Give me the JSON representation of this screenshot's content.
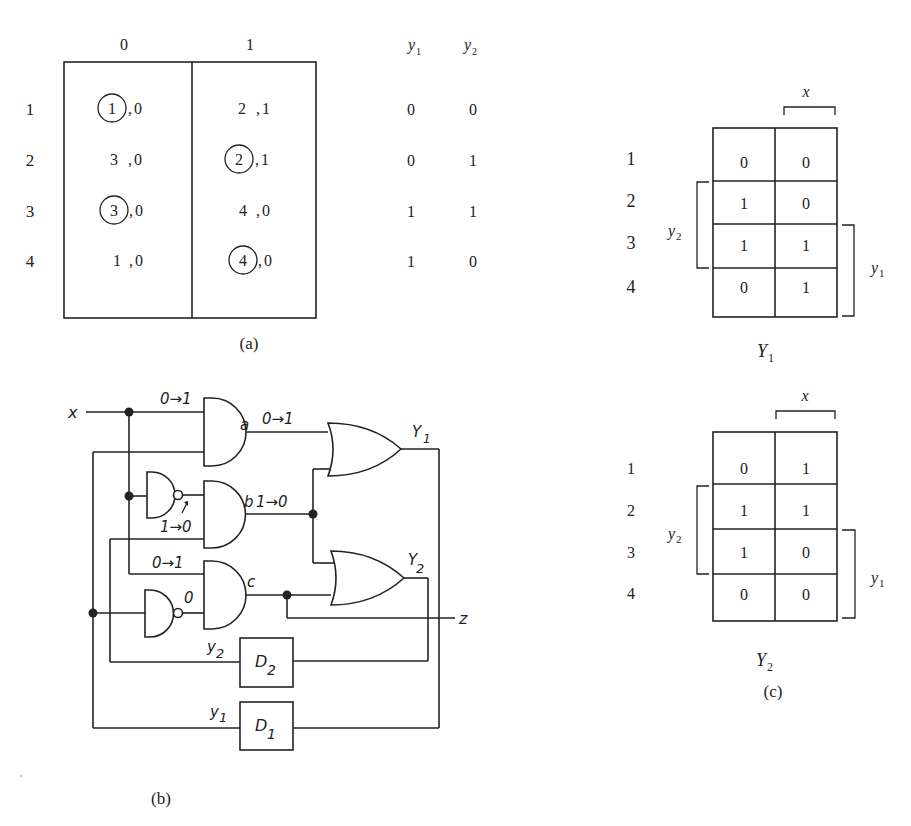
{
  "figure_a": {
    "caption": "(a)",
    "column_headers": [
      "0",
      "1"
    ],
    "output_headers": [
      "y1",
      "y2"
    ],
    "rows": [
      {
        "state": "1",
        "col0": {
          "next": "1",
          "stable": true,
          "z": "0"
        },
        "col1": {
          "next": "2",
          "stable": false,
          "z": "1"
        },
        "y1": "0",
        "y2": "0"
      },
      {
        "state": "2",
        "col0": {
          "next": "3",
          "stable": false,
          "z": "0"
        },
        "col1": {
          "next": "2",
          "stable": true,
          "z": "1"
        },
        "y1": "0",
        "y2": "1"
      },
      {
        "state": "3",
        "col0": {
          "next": "3",
          "stable": true,
          "z": "0"
        },
        "col1": {
          "next": "4",
          "stable": false,
          "z": "0"
        },
        "y1": "1",
        "y2": "1"
      },
      {
        "state": "4",
        "col0": {
          "next": "1",
          "stable": false,
          "z": "0"
        },
        "col1": {
          "next": "4",
          "stable": true,
          "z": "0"
        },
        "y1": "1",
        "y2": "0"
      }
    ]
  },
  "figure_b": {
    "caption": "(b)",
    "input_label": "x",
    "output_label": "z",
    "gate_labels": {
      "a": "a",
      "b": "b",
      "c": "c"
    },
    "transitions": {
      "x_input": "0→1",
      "a_out": "0→1",
      "b_out": "1→0",
      "not1_out": "1→0",
      "c_top_input": "0→1",
      "not2_out": "0"
    },
    "or_outputs": {
      "Y1": "Y",
      "Y1_sub": "1",
      "Y2": "Y",
      "Y2_sub": "2"
    },
    "delays": [
      {
        "name": "D",
        "sub": "2",
        "input_label": "y",
        "input_sub": "2"
      },
      {
        "name": "D",
        "sub": "1",
        "input_label": "y",
        "input_sub": "1"
      }
    ]
  },
  "figure_c": {
    "caption": "(c)",
    "maps": [
      {
        "title": "Y",
        "title_sub": "1",
        "x_label": "x",
        "y1_label": "y",
        "y1_sub": "1",
        "y2_label": "y",
        "y2_sub": "2",
        "row_labels": [
          "1",
          "2",
          "3",
          "4"
        ],
        "cells": [
          [
            "0",
            "0"
          ],
          [
            "1",
            "0"
          ],
          [
            "1",
            "1"
          ],
          [
            "0",
            "1"
          ]
        ]
      },
      {
        "title": "Y",
        "title_sub": "2",
        "x_label": "x",
        "y1_label": "y",
        "y1_sub": "1",
        "y2_label": "y",
        "y2_sub": "2",
        "row_labels": [
          "1",
          "2",
          "3",
          "4"
        ],
        "cells": [
          [
            "0",
            "1"
          ],
          [
            "1",
            "1"
          ],
          [
            "1",
            "0"
          ],
          [
            "0",
            "0"
          ]
        ]
      }
    ]
  }
}
